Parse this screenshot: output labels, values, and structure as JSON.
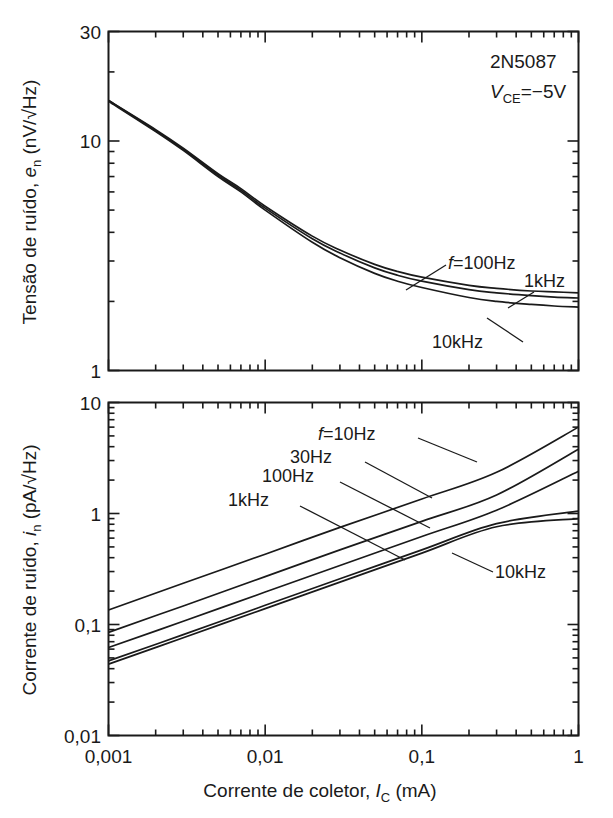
{
  "figure": {
    "background": "#ffffff",
    "line_color": "#1a1a1a",
    "text_color": "#1a1a1a"
  },
  "annotation": {
    "device": "2N5087",
    "bias_prefix": "V",
    "bias_sub": "CE",
    "bias_value": "=−5V"
  },
  "xaxis": {
    "title_main": "Corrente de coletor, ",
    "title_symbol": "I",
    "title_sub": "C",
    "title_unit": " (mA)",
    "ticks": [
      "0,001",
      "0,01",
      "0,1",
      "1"
    ],
    "min": 0.001,
    "max": 1
  },
  "top": {
    "ylabel_main": "Tensão de ruído, ",
    "ylabel_symbol": "e",
    "ylabel_sub": "n",
    "ylabel_unit": "  (nV/√Hz)",
    "ticks": [
      "30",
      "10",
      "1"
    ],
    "curve_labels": [
      "f=100Hz",
      "1kHz",
      "10kHz"
    ],
    "curve_label_f_italic": "f",
    "curve_label_f_rest": "=100Hz"
  },
  "bottom": {
    "ylabel_main": "Corrente de ruído, ",
    "ylabel_symbol": "i",
    "ylabel_sub": "n",
    "ylabel_unit": "  (pA/√Hz)",
    "ticks": [
      "10",
      "1",
      "0,1",
      "0,01"
    ],
    "curve_labels": [
      "f=10Hz",
      "30Hz",
      "100Hz",
      "1kHz",
      "10kHz"
    ],
    "curve_label_f_italic": "f",
    "curve_label_f_rest": "=10Hz"
  },
  "chart_data": [
    {
      "type": "line",
      "id": "noise-voltage",
      "title": "Tensão de ruído, e_n (nV/√Hz) vs Corrente de coletor",
      "xlabel": "Corrente de coletor, I_C (mA)",
      "ylabel": "Tensão de ruído, e_n (nV/√Hz)",
      "xscale": "log",
      "yscale": "log",
      "xlim": [
        0.001,
        1
      ],
      "ylim": [
        1,
        30
      ],
      "xticks": [
        0.001,
        0.01,
        0.1,
        1
      ],
      "xticklabels": [
        "0,001",
        "0,01",
        "0,1",
        "1"
      ],
      "yticks": [
        1,
        10,
        30
      ],
      "yticklabels": [
        "1",
        "10",
        "30"
      ],
      "grid": false,
      "legend": "inline-annotations",
      "device": "2N5087",
      "bias": "V_CE=−5V",
      "x": [
        0.001,
        0.002,
        0.003,
        0.005,
        0.007,
        0.01,
        0.02,
        0.03,
        0.05,
        0.07,
        0.1,
        0.2,
        0.3,
        0.5,
        0.7,
        1.0
      ],
      "series": [
        {
          "name": "f=100Hz",
          "values": [
            15.0,
            11.2,
            9.3,
            7.2,
            6.2,
            5.2,
            3.85,
            3.35,
            2.9,
            2.7,
            2.55,
            2.35,
            2.28,
            2.22,
            2.2,
            2.18
          ]
        },
        {
          "name": "1kHz",
          "values": [
            15.0,
            11.1,
            9.2,
            7.1,
            6.1,
            5.1,
            3.75,
            3.25,
            2.8,
            2.6,
            2.45,
            2.25,
            2.18,
            2.12,
            2.09,
            2.07
          ]
        },
        {
          "name": "10kHz",
          "values": [
            14.9,
            11.0,
            9.1,
            7.0,
            6.0,
            5.0,
            3.62,
            3.1,
            2.65,
            2.45,
            2.3,
            2.08,
            2.0,
            1.94,
            1.91,
            1.89
          ]
        }
      ]
    },
    {
      "type": "line",
      "id": "noise-current",
      "title": "Corrente de ruído, i_n (pA/√Hz) vs Corrente de coletor",
      "xlabel": "Corrente de coletor, I_C (mA)",
      "ylabel": "Corrente de ruído, i_n (pA/√Hz)",
      "xscale": "log",
      "yscale": "log",
      "xlim": [
        0.001,
        1
      ],
      "ylim": [
        0.01,
        10
      ],
      "xticks": [
        0.001,
        0.01,
        0.1,
        1
      ],
      "xticklabels": [
        "0,001",
        "0,01",
        "0,1",
        "1"
      ],
      "yticks": [
        0.01,
        0.1,
        1,
        10
      ],
      "yticklabels": [
        "0,01",
        "0,1",
        "1",
        "10"
      ],
      "grid": false,
      "legend": "inline-annotations",
      "x": [
        0.001,
        0.003,
        0.01,
        0.03,
        0.1,
        0.3,
        1.0
      ],
      "series": [
        {
          "name": "f=10Hz",
          "values": [
            0.135,
            0.235,
            0.43,
            0.75,
            1.35,
            2.35,
            6.0
          ]
        },
        {
          "name": "30Hz",
          "values": [
            0.085,
            0.147,
            0.27,
            0.47,
            0.85,
            1.47,
            3.8
          ]
        },
        {
          "name": "100Hz",
          "values": [
            0.062,
            0.107,
            0.196,
            0.34,
            0.62,
            1.07,
            2.4
          ]
        },
        {
          "name": "1kHz",
          "values": [
            0.047,
            0.081,
            0.149,
            0.258,
            0.47,
            0.81,
            1.05
          ]
        },
        {
          "name": "10kHz",
          "values": [
            0.044,
            0.076,
            0.139,
            0.241,
            0.44,
            0.76,
            0.9
          ]
        }
      ]
    }
  ]
}
